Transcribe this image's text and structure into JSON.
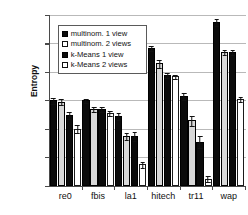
{
  "chart_data": {
    "type": "bar",
    "title": "",
    "xlabel": "",
    "ylabel": "Entropy",
    "ylim": [
      0.95,
      2.15
    ],
    "yticks": [
      "0,95",
      "1,15",
      "1,35",
      "1,55",
      "1,75",
      "1,95",
      "2,15"
    ],
    "ytick_values": [
      0.95,
      1.15,
      1.35,
      1.55,
      1.75,
      1.95,
      2.15
    ],
    "grid": true,
    "legend_position": "upper-left",
    "categories": [
      "re0",
      "fbis",
      "la1",
      "hitech",
      "tr11",
      "wap"
    ],
    "series": [
      {
        "name": "multinom. 1 view",
        "fill": "solid-black",
        "values": [
          1.55,
          1.55,
          1.44,
          1.92,
          1.58,
          2.1
        ],
        "errors": [
          0.025,
          0.018,
          0.03,
          0.022,
          0.03,
          0.03
        ]
      },
      {
        "name": "multinom. 2 views",
        "fill": "stippled-gray",
        "values": [
          1.54,
          1.49,
          1.3,
          1.81,
          1.41,
          1.89
        ],
        "errors": [
          0.025,
          0.02,
          0.03,
          0.03,
          0.04,
          0.022
        ]
      },
      {
        "name": "k-Means 1 view",
        "fill": "solid-black",
        "values": [
          1.45,
          1.49,
          1.3,
          1.73,
          1.26,
          1.89
        ],
        "errors": [
          0.028,
          0.02,
          0.035,
          0.022,
          0.045,
          0.022
        ]
      },
      {
        "name": "k-Means 2 views",
        "fill": "white-outline",
        "values": [
          1.35,
          1.46,
          1.1,
          1.72,
          1.0,
          1.56
        ],
        "errors": [
          0.03,
          0.02,
          0.022,
          0.018,
          0.022,
          0.018
        ]
      }
    ]
  },
  "legend": {
    "items": [
      {
        "label": "multinom. 1 view"
      },
      {
        "label": "multinom. 2 views"
      },
      {
        "label": "k-Means 1 view"
      },
      {
        "label": "k-Means 2 views"
      }
    ]
  },
  "colors": {
    "series_solid": "#0b0b0b",
    "series_stipple": "#d8d8d8",
    "series_white": "#ffffff",
    "axis": "#4a4a4a",
    "grid": "#b9b9b9",
    "text": "#111111"
  }
}
